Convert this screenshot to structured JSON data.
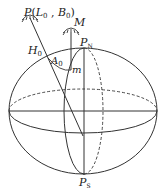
{
  "diagram": {
    "title": "",
    "labels": {
      "P": "P",
      "P_args_open": "(",
      "L": "L",
      "L_sub": "0",
      "comma": " , ",
      "B": "B",
      "B_sub": "0",
      "P_args_close": ")",
      "M": "M",
      "H": "H",
      "H_sub": "0",
      "A": "A",
      "A_sub": "0",
      "m": "m",
      "PN": "P",
      "PN_sub": "N",
      "PS": "P",
      "PS_sub": "S"
    },
    "stroke_color": "#333333"
  }
}
